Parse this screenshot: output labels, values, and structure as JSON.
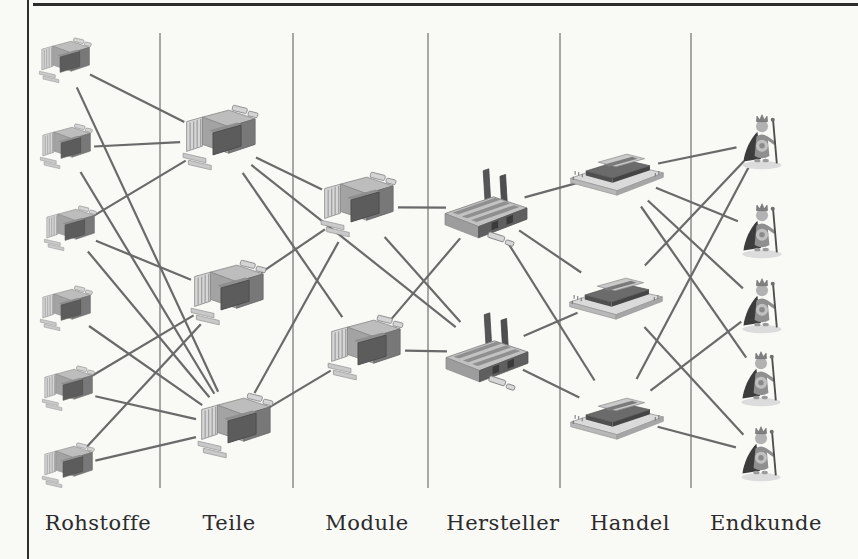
{
  "figure": {
    "columns": [
      {
        "id": "rohstoffe",
        "label": "Rohstoffe",
        "x": 98
      },
      {
        "id": "teile",
        "label": "Teile",
        "x": 229
      },
      {
        "id": "module",
        "label": "Module",
        "x": 367
      },
      {
        "id": "hersteller",
        "label": "Hersteller",
        "x": 503
      },
      {
        "id": "handel",
        "label": "Handel",
        "x": 630
      },
      {
        "id": "endkunde",
        "label": "Endkunde",
        "x": 766
      }
    ],
    "separators": {
      "x": [
        160,
        293,
        428,
        560,
        691
      ],
      "y_top": 33,
      "y_bottom": 488
    },
    "nodes": [
      {
        "id": "R1",
        "type": "factory_sm",
        "icon": "small-factory-icon",
        "x": 65,
        "y": 62,
        "r": 28
      },
      {
        "id": "R2",
        "type": "factory_sm",
        "icon": "small-factory-icon",
        "x": 66,
        "y": 148,
        "r": 28
      },
      {
        "id": "R3",
        "type": "factory_sm",
        "icon": "small-factory-icon",
        "x": 70,
        "y": 230,
        "r": 28
      },
      {
        "id": "R4",
        "type": "factory_sm",
        "icon": "small-factory-icon",
        "x": 66,
        "y": 310,
        "r": 28
      },
      {
        "id": "R5",
        "type": "factory_sm",
        "icon": "small-factory-icon",
        "x": 68,
        "y": 390,
        "r": 28
      },
      {
        "id": "R6",
        "type": "factory_sm",
        "icon": "small-factory-icon",
        "x": 68,
        "y": 467,
        "r": 28
      },
      {
        "id": "T1",
        "type": "factory_lg",
        "icon": "factory-icon",
        "x": 220,
        "y": 140,
        "r": 40
      },
      {
        "id": "T2",
        "type": "factory_lg",
        "icon": "factory-icon",
        "x": 228,
        "y": 295,
        "r": 40
      },
      {
        "id": "T3",
        "type": "factory_lg",
        "icon": "factory-icon",
        "x": 235,
        "y": 428,
        "r": 40
      },
      {
        "id": "M1",
        "type": "factory_lg",
        "icon": "factory-icon",
        "x": 358,
        "y": 207,
        "r": 40
      },
      {
        "id": "M2",
        "type": "factory_lg",
        "icon": "factory-icon",
        "x": 365,
        "y": 350,
        "r": 40
      },
      {
        "id": "H1",
        "type": "plant",
        "icon": "manufacturer-plant-icon",
        "x": 486,
        "y": 208,
        "r": 40
      },
      {
        "id": "H2",
        "type": "plant",
        "icon": "manufacturer-plant-icon",
        "x": 487,
        "y": 352,
        "r": 40
      },
      {
        "id": "Ha1",
        "type": "market",
        "icon": "trade-center-icon",
        "x": 617,
        "y": 172,
        "r": 42
      },
      {
        "id": "Ha2",
        "type": "market",
        "icon": "trade-center-icon",
        "x": 616,
        "y": 296,
        "r": 42
      },
      {
        "id": "Ha3",
        "type": "market",
        "icon": "trade-center-icon",
        "x": 617,
        "y": 416,
        "r": 42
      },
      {
        "id": "E1",
        "type": "king",
        "icon": "end-customer-king-icon",
        "x": 762,
        "y": 142,
        "r": 26
      },
      {
        "id": "E2",
        "type": "king",
        "icon": "end-customer-king-icon",
        "x": 762,
        "y": 231,
        "r": 26
      },
      {
        "id": "E3",
        "type": "king",
        "icon": "end-customer-king-icon",
        "x": 762,
        "y": 306,
        "r": 26
      },
      {
        "id": "E4",
        "type": "king",
        "icon": "end-customer-king-icon",
        "x": 761,
        "y": 379,
        "r": 26
      },
      {
        "id": "E5",
        "type": "king",
        "icon": "end-customer-king-icon",
        "x": 761,
        "y": 454,
        "r": 26
      }
    ],
    "edges": [
      [
        "R1",
        "T1"
      ],
      [
        "R1",
        "T3"
      ],
      [
        "R2",
        "T1"
      ],
      [
        "R2",
        "T3"
      ],
      [
        "R3",
        "T1"
      ],
      [
        "R3",
        "T2"
      ],
      [
        "R3",
        "T3"
      ],
      [
        "R4",
        "T3"
      ],
      [
        "R5",
        "T2"
      ],
      [
        "R5",
        "T3"
      ],
      [
        "R6",
        "T2"
      ],
      [
        "R6",
        "T3"
      ],
      [
        "T1",
        "M1"
      ],
      [
        "T1",
        "M2"
      ],
      [
        "T2",
        "M1"
      ],
      [
        "T3",
        "M1"
      ],
      [
        "T3",
        "M2"
      ],
      [
        "T1",
        "H2"
      ],
      [
        "M1",
        "H1"
      ],
      [
        "M1",
        "H2"
      ],
      [
        "M2",
        "H1"
      ],
      [
        "M2",
        "H2"
      ],
      [
        "H1",
        "Ha1"
      ],
      [
        "H1",
        "Ha2"
      ],
      [
        "H1",
        "Ha3"
      ],
      [
        "H2",
        "Ha2"
      ],
      [
        "H2",
        "Ha3"
      ],
      [
        "Ha1",
        "E1"
      ],
      [
        "Ha1",
        "E2"
      ],
      [
        "Ha1",
        "E3"
      ],
      [
        "Ha1",
        "E4"
      ],
      [
        "Ha2",
        "E1"
      ],
      [
        "Ha2",
        "E5"
      ],
      [
        "Ha3",
        "E1"
      ],
      [
        "Ha3",
        "E3"
      ],
      [
        "Ha3",
        "E5"
      ]
    ],
    "colors": {
      "background": "#f9f9f6",
      "frame": "#2d2d2d",
      "separator": "#858585",
      "edge": "#6a6a6a",
      "label": "#2b2b2b"
    }
  }
}
